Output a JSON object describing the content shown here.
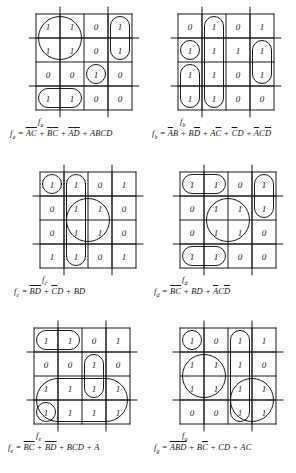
{
  "page": {
    "background_color": "#ffffff",
    "ink_color": "#1a1a1a",
    "columns": 2,
    "rows": 3
  },
  "kmaps": [
    {
      "id": "fa",
      "name_label": "f",
      "name_sub": "a",
      "formula_plain": "fa = A'C' + B'C' + A'D' + ABCD",
      "formula_html": "<i>f</i><span class='sub'>a</span> = <span class='ov'>A</span><span class='ov'>C</span> + <span class='ov'>B</span><span class='ov'>C</span> + <span class='ov'>A</span><span class='ov'>D</span> + ABCD",
      "grid": [
        [
          "1",
          "1",
          "0",
          "1"
        ],
        [
          "1",
          "1",
          "0",
          "1"
        ],
        [
          "0",
          "0",
          "1",
          "0"
        ],
        [
          "1",
          "1",
          "0",
          "0"
        ]
      ],
      "groups": [
        {
          "name": "group-A-C-bar",
          "r0": 0,
          "c0": 0,
          "r1": 1,
          "c1": 1
        },
        {
          "name": "group-A-D-bar",
          "r0": 0,
          "c0": 3,
          "r1": 1,
          "c1": 3
        },
        {
          "name": "group-B-C-bar",
          "r0": 3,
          "c0": 0,
          "r1": 3,
          "c1": 1
        },
        {
          "name": "group-ABCD",
          "r0": 2,
          "c0": 2,
          "r1": 2,
          "c1": 2
        }
      ]
    },
    {
      "id": "fb",
      "name_label": "f",
      "name_sub": "b",
      "formula_plain": "fb = A'B + BD' + AC' + C'D + A'CD'",
      "formula_html": "<i>f</i><span class='sub'>b</span> = <span class='ov'>A</span>B + B<span class='ov'>D</span> + A<span class='ov'>C</span> + <span class='ov'>C</span>D + <span class='ov'>A</span>C<span class='ov'>D</span>",
      "grid": [
        [
          "0",
          "1",
          "0",
          "1"
        ],
        [
          "1",
          "1",
          "1",
          "1"
        ],
        [
          "1",
          "1",
          "0",
          "1"
        ],
        [
          "1",
          "1",
          "0",
          "0"
        ]
      ],
      "groups": [
        {
          "name": "group-b-col1",
          "r0": 0,
          "c0": 1,
          "r1": 3,
          "c1": 1
        },
        {
          "name": "group-b-left",
          "r0": 2,
          "c0": 0,
          "r1": 3,
          "c1": 0
        },
        {
          "name": "group-b-row2-left",
          "r0": 1,
          "c0": 0,
          "r1": 1,
          "c1": 0
        },
        {
          "name": "group-b-right",
          "r0": 1,
          "c0": 3,
          "r1": 2,
          "c1": 3
        }
      ]
    },
    {
      "id": "fc",
      "name_label": "f",
      "name_sub": "c",
      "formula_plain": "fc = B'D' + C'D + BD",
      "formula_html": "<i>f</i><span class='sub'>c</span> = <span class='ov'>B</span><span class='ov'>D</span> + <span class='ov'>C</span>D + BD",
      "grid": [
        [
          "1",
          "1",
          "0",
          "1"
        ],
        [
          "0",
          "1",
          "1",
          "0"
        ],
        [
          "0",
          "1",
          "1",
          "0"
        ],
        [
          "1",
          "1",
          "0",
          "1"
        ]
      ],
      "groups": [
        {
          "name": "group-c-col1",
          "r0": 0,
          "c0": 1,
          "r1": 3,
          "c1": 1
        },
        {
          "name": "group-c-center",
          "r0": 1,
          "c0": 1,
          "r1": 2,
          "c1": 2
        },
        {
          "name": "group-c-corners",
          "r0": 0,
          "c0": 0,
          "r1": 0,
          "c1": 0
        }
      ]
    },
    {
      "id": "fd",
      "name_label": "f",
      "name_sub": "d",
      "formula_plain": "fd = B'C' + BD + A'CD'",
      "formula_html": "<i>f</i><span class='sub'>d</span> = <span class='ov'>B</span><span class='ov'>C</span> + BD + <span class='ov'>A</span>C<span class='ov'>D</span>",
      "grid": [
        [
          "1",
          "1",
          "0",
          "1"
        ],
        [
          "0",
          "1",
          "1",
          "1"
        ],
        [
          "0",
          "1",
          "1",
          "0"
        ],
        [
          "1",
          "1",
          "0",
          "0"
        ]
      ],
      "groups": [
        {
          "name": "group-d-top",
          "r0": 0,
          "c0": 0,
          "r1": 0,
          "c1": 1
        },
        {
          "name": "group-d-bottom",
          "r0": 3,
          "c0": 0,
          "r1": 3,
          "c1": 1
        },
        {
          "name": "group-d-center",
          "r0": 1,
          "c0": 1,
          "r1": 2,
          "c1": 2
        },
        {
          "name": "group-d-right",
          "r0": 0,
          "c0": 3,
          "r1": 1,
          "c1": 3
        }
      ]
    },
    {
      "id": "fe",
      "name_label": "f",
      "name_sub": "e",
      "formula_plain": "fe = B'C' + B'D' + BCD + A",
      "formula_html": "<i>f</i><span class='sub'>e</span> = <span class='ov'>B</span><span class='ov'>C</span> + <span class='ov'>B</span><span class='ov'>D</span> + BCD + A",
      "grid": [
        [
          "1",
          "1",
          "0",
          "1"
        ],
        [
          "0",
          "0",
          "1",
          "0"
        ],
        [
          "1",
          "1",
          "1",
          "1"
        ],
        [
          "1",
          "1",
          "1",
          "1"
        ]
      ],
      "groups": [
        {
          "name": "group-e-top-left",
          "r0": 0,
          "c0": 0,
          "r1": 0,
          "c1": 1
        },
        {
          "name": "group-e-col2",
          "r0": 1,
          "c0": 2,
          "r1": 2,
          "c1": 2
        },
        {
          "name": "group-e-bottom",
          "r0": 2,
          "c0": 0,
          "r1": 3,
          "c1": 3
        },
        {
          "name": "group-e-corner",
          "r0": 3,
          "c0": 0,
          "r1": 3,
          "c1": 0
        }
      ]
    },
    {
      "id": "fg",
      "name_label": "f",
      "name_sub": "g",
      "formula_plain": "fg = A'B'D' + BC' + CD + AC",
      "formula_html": "<i>f</i><span class='sub'>g</span> = <span class='ov'>A</span><span class='ov'>B</span><span class='ov'>D</span> + B<span class='ov'>C</span> + CD + AC",
      "grid": [
        [
          "1",
          "0",
          "1",
          "1"
        ],
        [
          "1",
          "1",
          "1",
          "0"
        ],
        [
          "1",
          "1",
          "1",
          "1"
        ],
        [
          "0",
          "0",
          "1",
          "1"
        ]
      ],
      "groups": [
        {
          "name": "group-g-left-block",
          "r0": 1,
          "c0": 0,
          "r1": 2,
          "c1": 1
        },
        {
          "name": "group-g-col2",
          "r0": 0,
          "c0": 2,
          "r1": 3,
          "c1": 2
        },
        {
          "name": "group-g-right",
          "r0": 2,
          "c0": 2,
          "r1": 3,
          "c1": 3
        },
        {
          "name": "group-g-top-left",
          "r0": 0,
          "c0": 0,
          "r1": 0,
          "c1": 0
        }
      ]
    }
  ]
}
